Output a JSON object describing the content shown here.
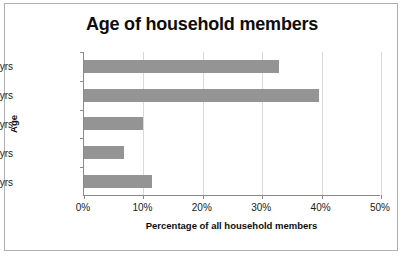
{
  "chart_data": {
    "type": "bar",
    "orientation": "horizontal",
    "title": "Age of household members",
    "xlabel": "Percentage of all household members",
    "ylabel": "Age",
    "categories": [
      "0-15 yrs",
      "16-24yrs",
      "25-44yrs",
      "45-64yrs",
      "65+yrs"
    ],
    "values": [
      11.5,
      6.8,
      9.9,
      39.5,
      32.8
    ],
    "xlim": [
      0,
      50
    ],
    "xticks": [
      0,
      10,
      20,
      30,
      40,
      50
    ],
    "xtick_labels": [
      "0%",
      "10%",
      "20%",
      "30%",
      "40%",
      "50%"
    ],
    "grid": "vertical",
    "legend": "none",
    "bar_color": "#949494",
    "gridline_color": "#d9d9d9",
    "axis_color": "#8a8a8a",
    "border_color": "#b0b0b0",
    "background": "#ffffff"
  }
}
